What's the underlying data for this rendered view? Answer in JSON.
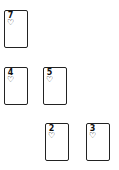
{
  "game": "solitaire-card-layout",
  "cards": [
    {
      "id": "card-7-hearts",
      "rank": "7",
      "suit": "♡",
      "suit_name": "hearts",
      "x": 4,
      "y": 10
    },
    {
      "id": "card-4-hearts",
      "rank": "4",
      "suit": "♡",
      "suit_name": "hearts",
      "x": 4,
      "y": 67
    },
    {
      "id": "card-5-hearts",
      "rank": "5",
      "suit": "♡",
      "suit_name": "hearts",
      "x": 43,
      "y": 67
    },
    {
      "id": "card-2-hearts",
      "rank": "2",
      "suit": "♡",
      "suit_name": "hearts",
      "x": 45,
      "y": 123
    },
    {
      "id": "card-3-hearts",
      "rank": "3",
      "suit": "♡",
      "suit_name": "hearts",
      "x": 86,
      "y": 123
    }
  ],
  "colors": {
    "background": "#ffffff",
    "card_border": "#222222",
    "card_text": "#111111"
  }
}
